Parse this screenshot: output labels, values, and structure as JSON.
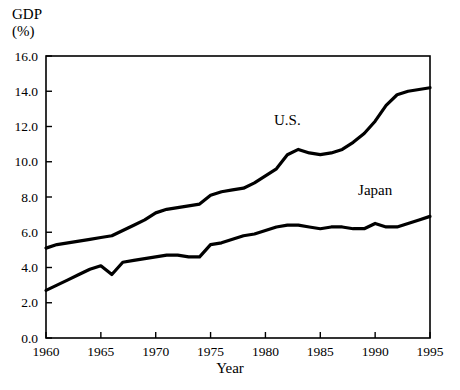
{
  "chart_data": {
    "type": "line",
    "title": "",
    "ylabel": "GDP\n(%)",
    "ylabel_line1": "GDP",
    "ylabel_line2": "(%)",
    "xlabel": "Year",
    "xlim": [
      1960,
      1995
    ],
    "ylim": [
      0.0,
      16.0
    ],
    "grid": false,
    "legend_position": "inline-annotation",
    "yticks": [
      "0.0",
      "2.0",
      "4.0",
      "6.0",
      "8.0",
      "10.0",
      "12.0",
      "14.0",
      "16.0"
    ],
    "ytick_values": [
      0.0,
      2.0,
      4.0,
      6.0,
      8.0,
      10.0,
      12.0,
      14.0,
      16.0
    ],
    "xticks": [
      "1960",
      "1965",
      "1970",
      "1975",
      "1980",
      "1985",
      "1990",
      "1995"
    ],
    "xtick_values": [
      1960,
      1965,
      1970,
      1975,
      1980,
      1985,
      1990,
      1995
    ],
    "x": [
      1960,
      1961,
      1962,
      1963,
      1964,
      1965,
      1966,
      1967,
      1968,
      1969,
      1970,
      1971,
      1972,
      1973,
      1974,
      1975,
      1976,
      1977,
      1978,
      1979,
      1980,
      1981,
      1982,
      1983,
      1984,
      1985,
      1986,
      1987,
      1988,
      1989,
      1990,
      1991,
      1992,
      1993,
      1994,
      1995
    ],
    "series": [
      {
        "name": "U.S.",
        "color": "#000000",
        "label_x": 1982,
        "label_y": 12.1,
        "values": [
          5.1,
          5.3,
          5.4,
          5.5,
          5.6,
          5.7,
          5.8,
          6.1,
          6.4,
          6.7,
          7.1,
          7.3,
          7.4,
          7.5,
          7.6,
          8.1,
          8.3,
          8.4,
          8.5,
          8.8,
          9.2,
          9.6,
          10.4,
          10.7,
          10.5,
          10.4,
          10.5,
          10.7,
          11.1,
          11.6,
          12.3,
          13.2,
          13.8,
          14.0,
          14.1,
          14.2
        ]
      },
      {
        "name": "Japan",
        "color": "#000000",
        "label_x": 1990,
        "label_y": 8.1,
        "values": [
          2.7,
          3.0,
          3.3,
          3.6,
          3.9,
          4.1,
          3.6,
          4.3,
          4.4,
          4.5,
          4.6,
          4.7,
          4.7,
          4.6,
          4.6,
          5.3,
          5.4,
          5.6,
          5.8,
          5.9,
          6.1,
          6.3,
          6.4,
          6.4,
          6.3,
          6.2,
          6.3,
          6.3,
          6.2,
          6.2,
          6.5,
          6.3,
          6.3,
          6.5,
          6.7,
          6.9
        ]
      }
    ]
  },
  "plot": {
    "left": 46,
    "right": 430,
    "top": 56,
    "bottom": 338,
    "line_width": 3.2,
    "frame_width": 1.6,
    "frame_color": "#000000",
    "background": "#ffffff"
  }
}
